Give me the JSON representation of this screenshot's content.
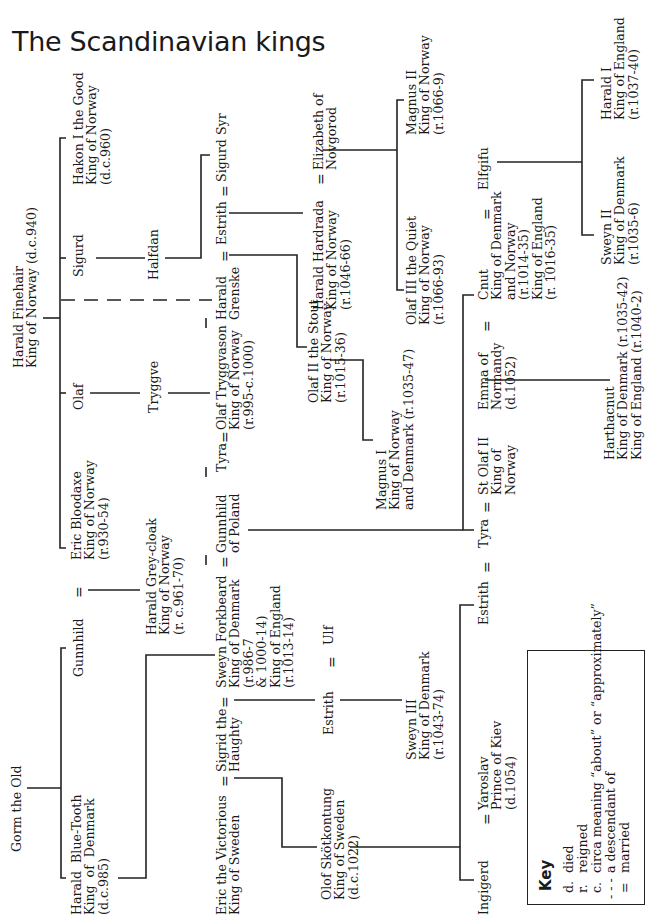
{
  "title": "The Scandinavian kings",
  "people": {
    "gorm": "Gorm the Old",
    "harald_bluetooth": "Harald  Blue-Tooth\nKing  of  Denmark\n(d.c.985)",
    "gunnhild": "Gunnhild",
    "harald_finehair": "Harald Finehair\nKing of Norway (d.c.940)",
    "eric_bloodaxe": "Eric Bloodaxe\nKing of Norway\n(r.930-54)",
    "olaf": "Olaf",
    "sigurd": "Sigurd",
    "hakon": "Hakon I the Good\nKing of Norway\n(d.c.960)",
    "harald_greycloak": "Harald Grey-cloak\nKing of Norway\n(r. c.961-70)",
    "tryggve": "Tryggve",
    "halfdan": "Halfdan",
    "eric_victorious": "Eric the Victorious\nKing of Sweden",
    "sigrid": "Sigrid the\nHaughty",
    "sweyn_forkbeard": "Sweyn Forkbeard\nKing of Denmark\n(r.986-7\n& 1000-14)\nKing of England\n(r.1013-14)",
    "gunnhild_poland": "Gunnhild\nof Poland",
    "tyra1": "Tyra",
    "olaf_tryggvason": "Olaf Tryggvason\nKing of Norway\n(r.995-c.1000)",
    "harald_grenske": "Harald\nGrenske",
    "estrith1": "Estrith",
    "sigurd_syr": "Sigurd Syr",
    "olof_skotkonung": "Olof Skötkontung\nKing of Sweden\n(d.c.1022)",
    "estrith2": "Estrith",
    "ulf": "Ulf",
    "olaf_stout": "Olaf II the Stout\nKing of Norway\n(r.1015-36)",
    "harald_hardrada": "Harald Hardrada\nKing of Norway\n(r.1046-66)",
    "elizabeth": "Elizabeth of\nNovgorod",
    "sweyn_iii": "Sweyn III\nKing of Denmark\n(r.1043-74)",
    "magnus_i": "Magnus I\nKing of Norway\nand Denmark (r.1035-47)",
    "olaf_quiet": "Olaf III the Quiet\nKing of Norway\n(r.1066-93)",
    "magnus_ii": "Magnus II\nKing of Norway\n(r.1066-9)",
    "ingigerd": "Ingigerd",
    "yaroslav": "Yaroslav\nPrince of Kiev\n(d.1054)",
    "estrith3": "Estrith",
    "tyra2": "Tyra",
    "st_olaf": "St Olaf II\nKing of\nNorway",
    "emma": "Emma of\nNormandy\n(d.1052)",
    "cnut": "Cnut\nKing of Denmark\nand Norway\n(r.1014-35)\nKing of England\n(r. 1016-35)",
    "elgifu": "Elfgifu",
    "harthacnut": "Harthacnut\nKing of Denmark (r.1035-42)\nKing of England (r.1040-2)",
    "sweyn_ii": "Sweyn II\nKing of Denmark\n(r.1035-6)",
    "harald_i": "Harald I\nKing of England\n(r.1037-40)"
  },
  "married_symbol": "=",
  "key": {
    "title": "Key",
    "entries": [
      {
        "symbol": "d.",
        "meaning": "died"
      },
      {
        "symbol": "r.",
        "meaning": "reigned"
      },
      {
        "symbol": "c.",
        "meaning": "circa meaning “about” or “approximately”"
      },
      {
        "symbol": "- - -",
        "meaning": "a descendant of"
      },
      {
        "symbol": "=",
        "meaning": "married"
      }
    ]
  }
}
